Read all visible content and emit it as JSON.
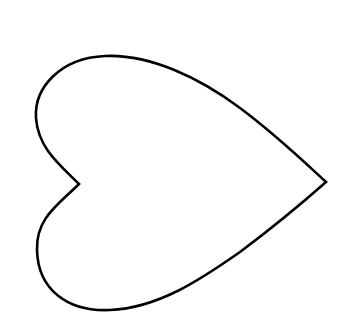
{
  "shape": {
    "type": "heart-outline",
    "orientation": "pointing-right",
    "stroke_color": "#000000",
    "fill_color": "#ffffff",
    "background": "#ffffff"
  }
}
